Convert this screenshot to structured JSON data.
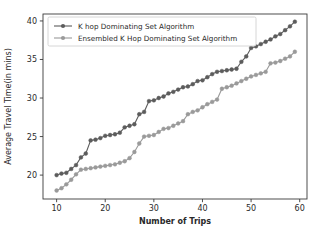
{
  "chart_data": {
    "type": "line",
    "title": "",
    "xlabel": "Number of Trips",
    "ylabel": "Average Travel Time(in mins)",
    "xlim": [
      7.2,
      61.5
    ],
    "ylim": [
      16.9,
      40.9
    ],
    "xticks": [
      10,
      20,
      30,
      40,
      50,
      60
    ],
    "yticks": [
      20,
      25,
      30,
      35,
      40
    ],
    "grid": false,
    "legend_position": "upper left",
    "x": [
      10,
      11,
      12,
      13,
      14,
      15,
      16,
      17,
      18,
      19,
      20,
      21,
      22,
      23,
      24,
      25,
      26,
      27,
      28,
      29,
      30,
      31,
      32,
      33,
      34,
      35,
      36,
      37,
      38,
      39,
      40,
      41,
      42,
      43,
      44,
      45,
      46,
      47,
      48,
      49,
      50,
      51,
      52,
      53,
      54,
      55,
      56,
      57,
      58,
      59
    ],
    "series": [
      {
        "name": "K hop Dominating Set Algorithm",
        "color": "#5c5c5c",
        "marker": "o",
        "values": [
          20.0,
          20.2,
          20.3,
          20.8,
          21.3,
          22.3,
          22.8,
          24.5,
          24.6,
          24.8,
          25.1,
          25.2,
          25.3,
          25.5,
          26.2,
          26.4,
          26.6,
          27.9,
          28.2,
          29.6,
          29.7,
          30.0,
          30.2,
          30.6,
          30.8,
          31.1,
          31.4,
          31.5,
          31.8,
          32.2,
          32.3,
          32.7,
          33.1,
          33.4,
          33.5,
          33.6,
          33.7,
          33.8,
          34.7,
          35.4,
          36.5,
          36.7,
          37.0,
          37.3,
          37.6,
          38.0,
          38.3,
          38.8,
          39.3,
          39.9
        ]
      },
      {
        "name": "Ensembled K Hop Dominating Set Algorithm",
        "color": "#9a9a9a",
        "marker": "o",
        "values": [
          18.0,
          18.3,
          18.8,
          19.4,
          20.1,
          20.7,
          20.8,
          20.9,
          21.0,
          21.1,
          21.2,
          21.3,
          21.4,
          21.6,
          21.8,
          22.2,
          23.0,
          24.1,
          25.0,
          25.1,
          25.2,
          25.6,
          26.0,
          26.1,
          26.4,
          26.7,
          27.0,
          27.9,
          28.2,
          28.4,
          28.8,
          29.2,
          29.5,
          29.8,
          31.2,
          31.4,
          31.6,
          31.9,
          32.2,
          32.5,
          32.8,
          33.0,
          33.2,
          33.4,
          34.5,
          34.6,
          34.8,
          35.1,
          35.4,
          36.0
        ]
      }
    ]
  }
}
